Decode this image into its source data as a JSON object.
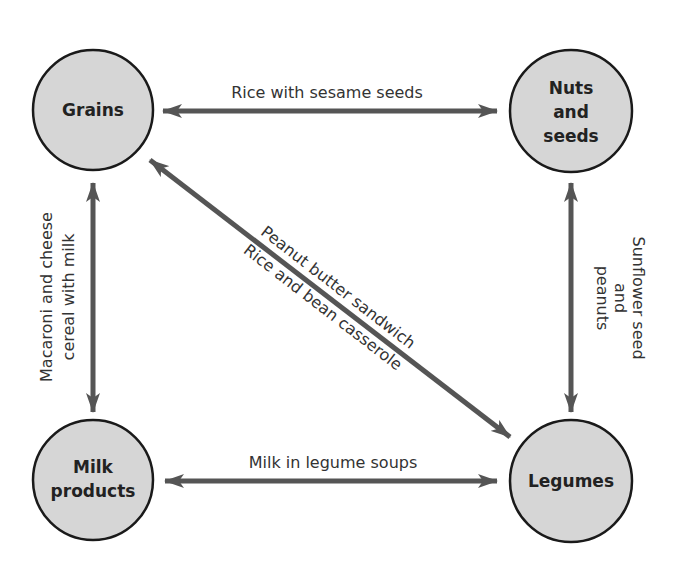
{
  "colors": {
    "node_fill": "#d6d6d6",
    "node_stroke": "#1a1a1a",
    "arrow": "#555555",
    "text": "#2a2a2a"
  },
  "nodes": [
    {
      "id": "grains",
      "lines": [
        "Grains"
      ]
    },
    {
      "id": "nuts_seeds",
      "lines": [
        "Nuts",
        "and",
        "seeds"
      ]
    },
    {
      "id": "milk_products",
      "lines": [
        "Milk",
        "products"
      ]
    },
    {
      "id": "legumes",
      "lines": [
        "Legumes"
      ]
    }
  ],
  "edges": [
    {
      "from": "grains",
      "to": "nuts_seeds",
      "labels": [
        "Rice with sesame seeds"
      ]
    },
    {
      "from": "grains",
      "to": "milk_products",
      "labels": [
        "Macaroni and cheese",
        "cereal with milk"
      ]
    },
    {
      "from": "grains",
      "to": "legumes",
      "labels": [
        "Peanut butter sandwich",
        "Rice and bean casserole"
      ]
    },
    {
      "from": "nuts_seeds",
      "to": "legumes",
      "labels": [
        "Sunflower seed",
        "and",
        "peanuts"
      ]
    },
    {
      "from": "milk_products",
      "to": "legumes",
      "labels": [
        "Milk in legume soups"
      ]
    }
  ]
}
